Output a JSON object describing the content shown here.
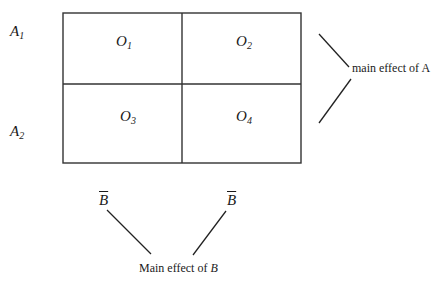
{
  "row_labels": [
    {
      "base": "A",
      "sub": "1"
    },
    {
      "base": "A",
      "sub": "2"
    }
  ],
  "cells": [
    {
      "base": "O",
      "sub": "1"
    },
    {
      "base": "O",
      "sub": "2"
    },
    {
      "base": "O",
      "sub": "3"
    },
    {
      "base": "O",
      "sub": "4"
    }
  ],
  "main_effect_a": {
    "text": "main effect of A"
  },
  "column_means": [
    {
      "label": "B"
    },
    {
      "label": "B"
    }
  ],
  "main_effect_b": {
    "prefix": "Main effect of ",
    "var": "B"
  },
  "colors": {
    "line": "#1a1a1a",
    "background": "#ffffff"
  }
}
